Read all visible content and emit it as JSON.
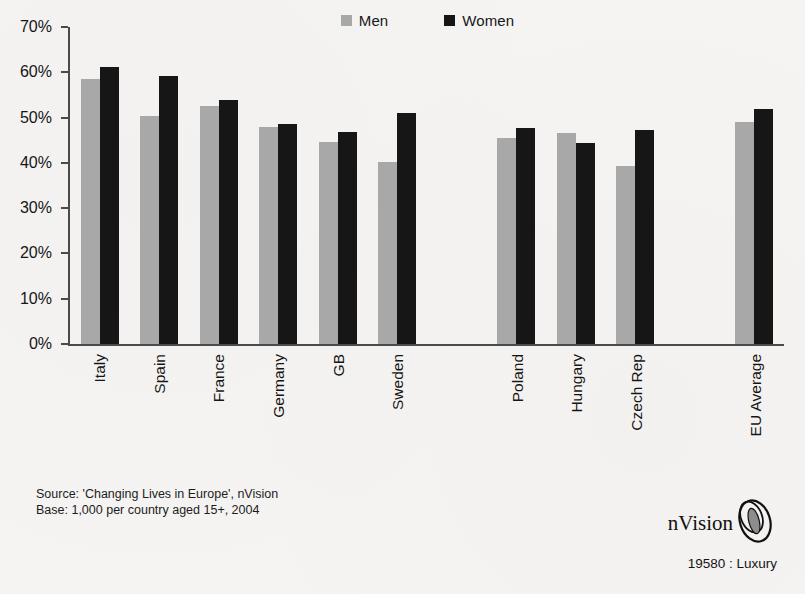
{
  "legend": {
    "items": [
      {
        "label": "Men",
        "color": "#a8a8a8",
        "swatch_name": "legend-swatch-men"
      },
      {
        "label": "Women",
        "color": "#161616",
        "swatch_name": "legend-swatch-women"
      }
    ]
  },
  "chart_data": {
    "type": "bar",
    "title": "",
    "subtitle": "",
    "xlabel": "",
    "ylabel": "",
    "grid": false,
    "legend_position": "top-center",
    "ylim": [
      0,
      70
    ],
    "ytick_labels": [
      "70%",
      "60%",
      "50%",
      "40%",
      "30%",
      "20%",
      "10%",
      "0%"
    ],
    "ytick_values": [
      70,
      60,
      50,
      40,
      30,
      20,
      10,
      0
    ],
    "categories": [
      "Italy",
      "Spain",
      "France",
      "Germany",
      "GB",
      "Sweden",
      "",
      "Poland",
      "Hungary",
      "Czech Rep",
      "",
      "EU Average"
    ],
    "series": [
      {
        "name": "Men",
        "color": "#a8a8a8",
        "values": [
          58.5,
          50.4,
          52.5,
          48.0,
          44.5,
          40.2,
          null,
          45.5,
          46.6,
          39.3,
          null,
          49.0
        ]
      },
      {
        "name": "Women",
        "color": "#161616",
        "values": [
          61.2,
          59.1,
          53.9,
          48.6,
          46.9,
          51.0,
          null,
          47.6,
          44.3,
          47.2,
          null,
          52.0
        ]
      }
    ]
  },
  "source": {
    "line1": "Source: 'Changing Lives in Europe', nVision",
    "line2": "Base: 1,000 per country aged 15+, 2004"
  },
  "brand": {
    "name": "nVision",
    "code": "19580 : Luxury",
    "mark_name": "nvision-ellipse-logo-icon"
  }
}
